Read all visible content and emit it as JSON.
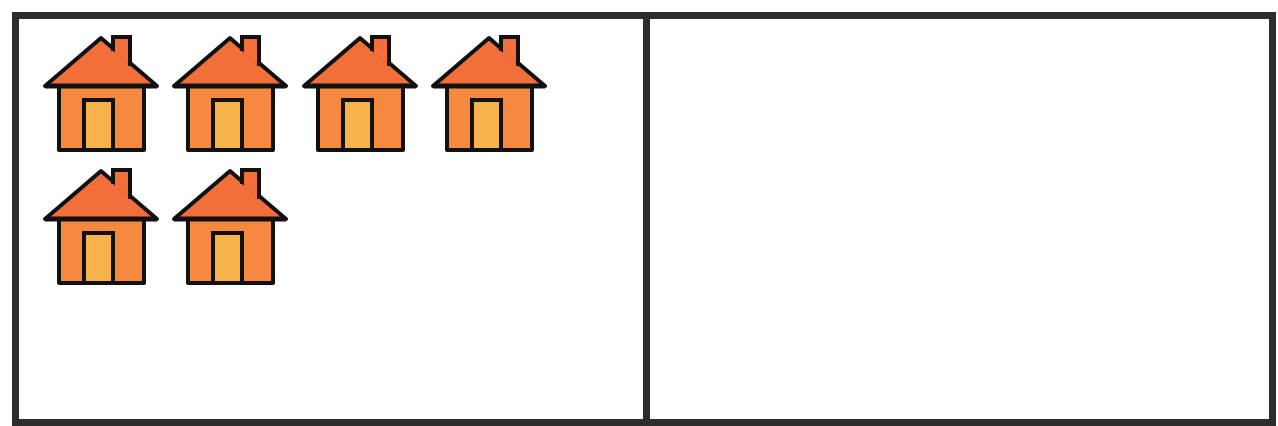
{
  "figure": {
    "type": "two-panel counting frame",
    "panels": [
      {
        "id": "left",
        "content": "houses",
        "count": 6,
        "layout": {
          "columns": 4,
          "rows": 2
        },
        "items": [
          {
            "icon": "house-icon",
            "row": 0,
            "col": 0
          },
          {
            "icon": "house-icon",
            "row": 0,
            "col": 1
          },
          {
            "icon": "house-icon",
            "row": 0,
            "col": 2
          },
          {
            "icon": "house-icon",
            "row": 0,
            "col": 3
          },
          {
            "icon": "house-icon",
            "row": 1,
            "col": 0
          },
          {
            "icon": "house-icon",
            "row": 1,
            "col": 1
          }
        ]
      },
      {
        "id": "right",
        "content": "empty",
        "count": 0,
        "items": []
      }
    ]
  },
  "colors": {
    "border": "#2e2c2d",
    "roof": "#f26f3a",
    "wall": "#f4893f",
    "door": "#f7b34b",
    "outline": "#111111",
    "background": "#ffffff"
  }
}
